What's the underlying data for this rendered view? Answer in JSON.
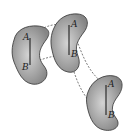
{
  "diagram": {
    "type": "rigid-body-translation",
    "colors": {
      "body_fill_center": "#cfcfcf",
      "body_fill_edge": "#8a8a8a",
      "outline": "#333333",
      "segment": "#111111",
      "trajectory": "#444444"
    },
    "bodies": [
      {
        "position": "left",
        "label_a": "A",
        "label_b": "B"
      },
      {
        "position": "middle",
        "label_a": "A",
        "label_b": "B"
      },
      {
        "position": "right",
        "label_a": "A",
        "label_b": "B"
      }
    ],
    "trajectories": [
      "path of point A",
      "path of point B"
    ]
  }
}
